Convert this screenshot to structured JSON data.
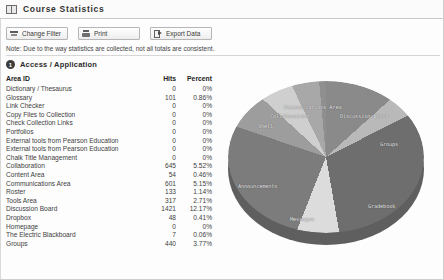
{
  "window": {
    "title": "Course Statistics",
    "title_icon": "book-icon"
  },
  "toolbar": {
    "buttons": [
      {
        "label": "Change Filter",
        "icon": "filter-icon"
      },
      {
        "label": "Print",
        "icon": "printer-icon"
      },
      {
        "label": "Export Data",
        "icon": "export-icon"
      }
    ]
  },
  "note": "Note: Due to the way statistics are collected, not all totals are consistent.",
  "section": {
    "number": "1",
    "title": "Access / Application"
  },
  "table": {
    "columns": [
      "Area ID",
      "Hits",
      "Percent"
    ],
    "rows": [
      {
        "area": "Dictionary / Thesaurus",
        "hits": "0",
        "percent": "0%"
      },
      {
        "area": "Glossary",
        "hits": "101",
        "percent": "0.86%"
      },
      {
        "area": "Link Checker",
        "hits": "0",
        "percent": "0%"
      },
      {
        "area": "Copy Files to Collection",
        "hits": "0",
        "percent": "0%"
      },
      {
        "area": "Check Collection Links",
        "hits": "0",
        "percent": "0%"
      },
      {
        "area": "Portfolios",
        "hits": "0",
        "percent": "0%"
      },
      {
        "area": "External tools from Pearson Education",
        "hits": "0",
        "percent": "0%"
      },
      {
        "area": "External tools from Pearson Education",
        "hits": "0",
        "percent": "0%"
      },
      {
        "area": "Chalk Title Management",
        "hits": "0",
        "percent": "0%"
      },
      {
        "area": "Collaboration",
        "hits": "645",
        "percent": "5.52%"
      },
      {
        "area": "Content Area",
        "hits": "54",
        "percent": "0.46%"
      },
      {
        "area": "Communications Area",
        "hits": "601",
        "percent": "5.15%"
      },
      {
        "area": "Roster",
        "hits": "133",
        "percent": "1.14%"
      },
      {
        "area": "Tools Area",
        "hits": "317",
        "percent": "2.71%"
      },
      {
        "area": "Discussion Board",
        "hits": "1421",
        "percent": "12.17%"
      },
      {
        "area": "Dropbox",
        "hits": "48",
        "percent": "0.41%"
      },
      {
        "area": "Homepage",
        "hits": "0",
        "percent": "0%"
      },
      {
        "area": "The Electric Blackboard",
        "hits": "7",
        "percent": "0.06%"
      },
      {
        "area": "Groups",
        "hits": "440",
        "percent": "3.77%"
      }
    ]
  },
  "chart_data": {
    "type": "pie",
    "title": "",
    "three_d": true,
    "legend_position": "none",
    "labels_on_slices": true,
    "categories": [
      "Discussion Board",
      "Groups",
      "Gradebook",
      "Messages",
      "Announcements",
      "Shell",
      "Collaboration",
      "Communications Area",
      "Content Area",
      "Glossary"
    ],
    "values": [
      12.17,
      3.77,
      27.0,
      8.0,
      22.0,
      6.0,
      5.52,
      5.15,
      0.46,
      0.86
    ],
    "value_unit": "percent",
    "slice_labels": [
      {
        "text": "Discussion Board",
        "x": 112,
        "y": 42
      },
      {
        "text": "Groups",
        "x": 152,
        "y": 70
      },
      {
        "text": "Gradebook",
        "x": 140,
        "y": 132
      },
      {
        "text": "Messages",
        "x": 62,
        "y": 145
      },
      {
        "text": "Announcements",
        "x": 10,
        "y": 112
      },
      {
        "text": "Shell",
        "x": 30,
        "y": 52
      },
      {
        "text": "Collaboration",
        "x": 42,
        "y": 42
      },
      {
        "text": "Communications Area",
        "x": 56,
        "y": 33
      }
    ],
    "colors": {
      "discussion_board": "#8a8a8a",
      "groups": "#b9b9b9",
      "gradebook": "#6e6e6e",
      "messages": "#dcdcdc",
      "announcements": "#7c7c7c",
      "shell": "#9d9d9d",
      "collaboration": "#cfcfcf",
      "communications_area": "#a8a8a8",
      "small_slices": "#8f8f8f",
      "depth": "#5f5f5f"
    }
  }
}
